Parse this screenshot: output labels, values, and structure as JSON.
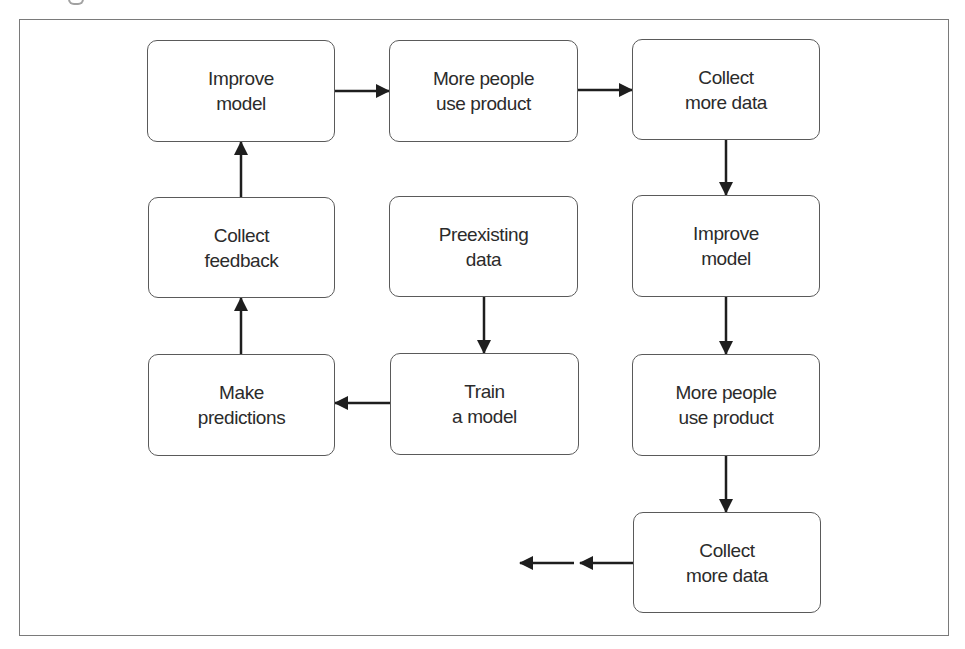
{
  "diagram": {
    "type": "flowchart",
    "colors": {
      "frame": "#7a7a7a",
      "node_border": "#5a5a5a",
      "arrow": "#1e1e1e",
      "text": "#2b2b2b",
      "background": "#ffffff"
    },
    "nodes": [
      {
        "id": "improve_model_top",
        "lines": [
          "Improve",
          "model"
        ]
      },
      {
        "id": "more_people_top",
        "lines": [
          "More people",
          "use product"
        ]
      },
      {
        "id": "collect_more_data_top",
        "lines": [
          "Collect",
          "more data"
        ]
      },
      {
        "id": "collect_feedback",
        "lines": [
          "Collect",
          "feedback"
        ]
      },
      {
        "id": "preexisting_data",
        "lines": [
          "Preexisting",
          "data"
        ]
      },
      {
        "id": "improve_model_right",
        "lines": [
          "Improve",
          "model"
        ]
      },
      {
        "id": "make_predictions",
        "lines": [
          "Make",
          "predictions"
        ]
      },
      {
        "id": "train_model",
        "lines": [
          "Train",
          "a model"
        ]
      },
      {
        "id": "more_people_right",
        "lines": [
          "More people",
          "use product"
        ]
      },
      {
        "id": "collect_more_data_bottom",
        "lines": [
          "Collect",
          "more data"
        ]
      }
    ],
    "edges": [
      {
        "from": "preexisting_data",
        "to": "train_model"
      },
      {
        "from": "train_model",
        "to": "make_predictions"
      },
      {
        "from": "make_predictions",
        "to": "collect_feedback"
      },
      {
        "from": "collect_feedback",
        "to": "improve_model_top"
      },
      {
        "from": "improve_model_top",
        "to": "more_people_top"
      },
      {
        "from": "more_people_top",
        "to": "collect_more_data_top"
      },
      {
        "from": "collect_more_data_top",
        "to": "improve_model_right"
      },
      {
        "from": "improve_model_right",
        "to": "more_people_right"
      },
      {
        "from": "more_people_right",
        "to": "collect_more_data_bottom"
      },
      {
        "from": "collect_more_data_bottom",
        "to": "continues (left, dashed-style double arrow)"
      }
    ]
  }
}
